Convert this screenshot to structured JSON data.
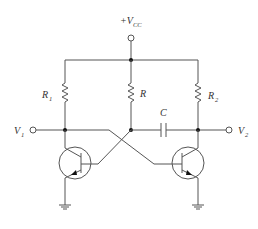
{
  "diagram": {
    "type": "circuit-schematic",
    "supply": {
      "label": "+V",
      "subscript": "CC"
    },
    "components": {
      "r1": {
        "label": "R",
        "subscript": "1"
      },
      "r": {
        "label": "R",
        "subscript": ""
      },
      "r2": {
        "label": "R",
        "subscript": "2"
      },
      "c": {
        "label": "C",
        "subscript": ""
      },
      "q1": {
        "type": "npn-transistor"
      },
      "q2": {
        "type": "npn-transistor"
      }
    },
    "terminals": {
      "v1": {
        "label": "V",
        "subscript": "1"
      },
      "v2": {
        "label": "V",
        "subscript": "2"
      }
    },
    "colors": {
      "wire": "#555555",
      "background": "#ffffff"
    }
  }
}
